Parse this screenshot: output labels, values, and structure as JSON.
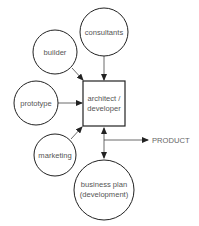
{
  "diagram": {
    "nodes": {
      "consultants": {
        "label": "consultants"
      },
      "builder": {
        "label": "builder"
      },
      "prototype": {
        "label": "prototype"
      },
      "center": {
        "line1": "architect /",
        "line2": "developer"
      },
      "marketing": {
        "label": "marketing"
      },
      "business_plan": {
        "line1": "business plan",
        "line2": "(development)"
      }
    },
    "output": {
      "label": "PRODUCT"
    },
    "edges": [
      {
        "from": "consultants",
        "to": "architect / developer"
      },
      {
        "from": "builder",
        "to": "architect / developer"
      },
      {
        "from": "prototype",
        "to": "architect / developer"
      },
      {
        "from": "marketing",
        "to": "architect / developer"
      },
      {
        "from": "architect / developer",
        "to": "business plan (development)",
        "bidirectional": true
      },
      {
        "from": "architect / developer",
        "to": "PRODUCT"
      }
    ]
  }
}
